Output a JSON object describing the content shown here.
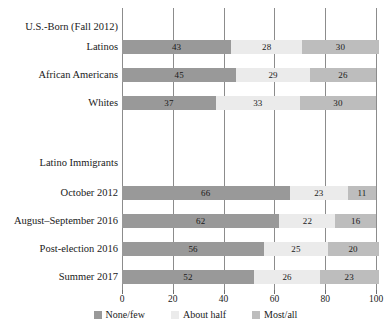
{
  "chart_data": {
    "type": "bar",
    "subtype": "stacked-horizontal-100",
    "title": "",
    "xlabel": "",
    "ylabel": "",
    "xlim": [
      0,
      100
    ],
    "xticks": [
      0,
      20,
      40,
      60,
      80,
      100
    ],
    "xtick_labels": [
      "0",
      "20",
      "40",
      "60",
      "80",
      "100"
    ],
    "grid": true,
    "legend_position": "bottom-center",
    "legend": [
      "None/few",
      "About half",
      "Most/all"
    ],
    "series": [
      {
        "name": "None/few",
        "color": "#999999",
        "values": [
          43,
          45,
          37,
          66,
          62,
          56,
          52
        ]
      },
      {
        "name": "About half",
        "color": "#ebebeb",
        "values": [
          28,
          29,
          33,
          23,
          22,
          25,
          26
        ]
      },
      {
        "name": "Most/all",
        "color": "#bdbdbd",
        "values": [
          30,
          26,
          30,
          11,
          16,
          20,
          23
        ]
      }
    ],
    "categories": [
      "Latinos",
      "African Americans",
      "Whites",
      "October 2012",
      "August–September 2016",
      "Post-election 2016",
      "Summer 2017"
    ],
    "groups": [
      {
        "header": "U.S.-Born (Fall 2012)",
        "categories": [
          "Latinos",
          "African Americans",
          "Whites"
        ]
      },
      {
        "header": "Latino Immigrants",
        "categories": [
          "October 2012",
          "August–September 2016",
          "Post-election 2016",
          "Summer 2017"
        ]
      }
    ],
    "rows": [
      {
        "label": "Latinos",
        "segments": [
          43,
          28,
          30
        ]
      },
      {
        "label": "African Americans",
        "segments": [
          45,
          29,
          26
        ]
      },
      {
        "label": "Whites",
        "segments": [
          37,
          33,
          30
        ]
      },
      {
        "label": "October 2012",
        "segments": [
          66,
          23,
          11
        ]
      },
      {
        "label": "August–September 2016",
        "segments": [
          62,
          22,
          16
        ]
      },
      {
        "label": "Post-election 2016",
        "segments": [
          56,
          25,
          20
        ]
      },
      {
        "label": "Summer 2017",
        "segments": [
          52,
          26,
          23
        ]
      }
    ]
  },
  "colors": {
    "none_few": "#999999",
    "about_half": "#ebebeb",
    "most_all": "#bdbdbd",
    "gridline": "#8c8c8c",
    "text": "#1a1a1a",
    "background": "#ffffff"
  }
}
